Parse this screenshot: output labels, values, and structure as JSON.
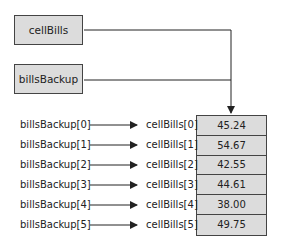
{
  "diagram": {
    "references": [
      {
        "name": "cellBills"
      },
      {
        "name": "billsBackup"
      }
    ],
    "array": {
      "values": [
        "45.24",
        "54.67",
        "42.55",
        "44.61",
        "38.00",
        "49.75"
      ]
    },
    "mappings": [
      {
        "alias": "billsBackup[0]",
        "element": "cellBills[0]"
      },
      {
        "alias": "billsBackup[1]",
        "element": "cellBills[1]"
      },
      {
        "alias": "billsBackup[2]",
        "element": "cellBills[2]"
      },
      {
        "alias": "billsBackup[3]",
        "element": "cellBills[3]"
      },
      {
        "alias": "billsBackup[4]",
        "element": "cellBills[4]"
      },
      {
        "alias": "billsBackup[5]",
        "element": "cellBills[5]"
      }
    ],
    "colors": {
      "box_fill": "#dcdcdc",
      "stroke": "#444444"
    }
  }
}
